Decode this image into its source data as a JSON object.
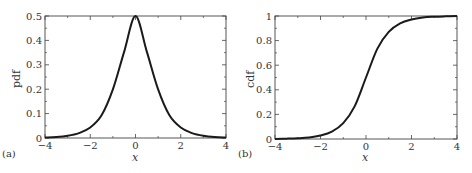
{
  "chart_data": [
    {
      "panel": "(a)",
      "type": "line",
      "title": "",
      "xlabel": "x",
      "ylabel": "pdf",
      "xlim": [
        -4,
        4
      ],
      "ylim": [
        0,
        0.5
      ],
      "xticks": [
        -4,
        -2,
        0,
        2,
        4
      ],
      "xtick_labels": [
        "−4",
        "−2",
        "0",
        "2",
        "4"
      ],
      "yticks": [
        0,
        0.1,
        0.2,
        0.3,
        0.4,
        0.5
      ],
      "ytick_labels": [
        "0",
        "0.1",
        "0.2",
        "0.3",
        "0.4",
        "0.5"
      ],
      "grid": false,
      "legend": null,
      "series": [
        {
          "name": "pdf",
          "x": [
            -4,
            -3.5,
            -3,
            -2.5,
            -2,
            -1.5,
            -1,
            -0.5,
            0,
            0.5,
            1,
            1.5,
            2,
            2.5,
            3,
            3.5,
            4
          ],
          "y": [
            0.002,
            0.004,
            0.009,
            0.02,
            0.043,
            0.093,
            0.199,
            0.354,
            0.5,
            0.354,
            0.199,
            0.093,
            0.043,
            0.02,
            0.009,
            0.004,
            0.002
          ]
        }
      ]
    },
    {
      "panel": "(b)",
      "type": "line",
      "title": "",
      "xlabel": "x",
      "ylabel": "cdf",
      "xlim": [
        -4,
        4
      ],
      "ylim": [
        0,
        1
      ],
      "xticks": [
        -4,
        -2,
        0,
        2,
        4
      ],
      "xtick_labels": [
        "−4",
        "−2",
        "0",
        "2",
        "4"
      ],
      "yticks": [
        0,
        0.2,
        0.4,
        0.6,
        0.8,
        1
      ],
      "ytick_labels": [
        "0",
        "0.2",
        "0.4",
        "0.6",
        "0.8",
        "1"
      ],
      "grid": false,
      "legend": null,
      "series": [
        {
          "name": "cdf",
          "x": [
            -4,
            -3.5,
            -3,
            -2.5,
            -2,
            -1.5,
            -1,
            -0.5,
            0,
            0.5,
            1,
            1.5,
            2,
            2.5,
            3,
            3.5,
            4
          ],
          "y": [
            0.001,
            0.003,
            0.006,
            0.012,
            0.028,
            0.06,
            0.129,
            0.265,
            0.5,
            0.735,
            0.871,
            0.94,
            0.972,
            0.988,
            0.994,
            0.997,
            0.999
          ]
        }
      ]
    }
  ],
  "panels": {
    "a": {
      "label": "(a)",
      "xlabel": "x",
      "ylabel": "pdf"
    },
    "b": {
      "label": "(b)",
      "xlabel": "x",
      "ylabel": "cdf"
    }
  },
  "style": {
    "line_color": "#1a1a1a",
    "axis_color": "#444444"
  }
}
